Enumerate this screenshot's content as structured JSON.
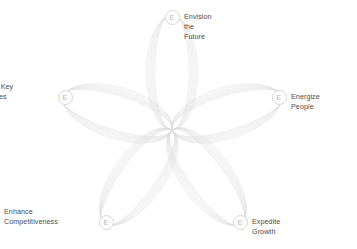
{
  "diagram": {
    "type": "radial-rosette",
    "title": "",
    "center": {
      "x": 172,
      "y": 130
    },
    "petal_count": 5,
    "strands_per_petal": 8,
    "stroke_color": "#dcdcdc",
    "badge_border_color": "#d6d6d6",
    "badge_letter_color": "#b5b5b5",
    "label_color": "#4d4d4d",
    "background_color": "#ffffff",
    "nodes": [
      {
        "id": "envision-the-future",
        "label": "Envision the Future",
        "badge_letter": "E",
        "x": 172,
        "y": 17,
        "angle_deg": 90,
        "label_position": "right"
      },
      {
        "id": "energize-people",
        "label": "Energize People",
        "badge_letter": "E",
        "x": 279,
        "y": 97,
        "angle_deg": 18,
        "label_position": "right"
      },
      {
        "id": "expedite-growth",
        "label": "Expedite Growth",
        "badge_letter": "E",
        "x": 240,
        "y": 222,
        "angle_deg": -54,
        "label_position": "right"
      },
      {
        "id": "enhance-competitiveness",
        "label": "Enhance\nCompetitiveness",
        "badge_letter": "E",
        "x": 106,
        "y": 222,
        "angle_deg": -126,
        "label_position": "left"
      },
      {
        "id": "establish-key-capabilities",
        "label": "Establish Key\nCapabilities",
        "badge_letter": "E",
        "x": 65,
        "y": 97,
        "angle_deg": 162,
        "label_position": "left"
      }
    ]
  }
}
